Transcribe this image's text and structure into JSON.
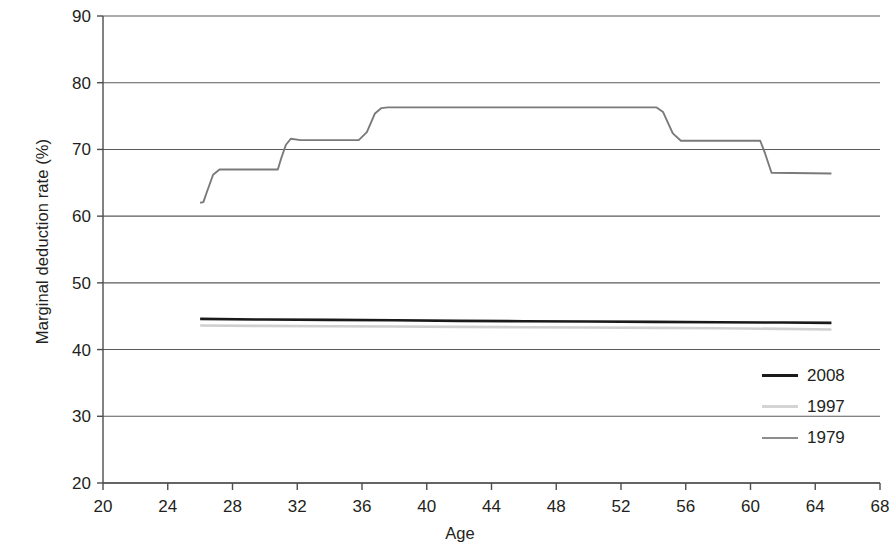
{
  "chart_data": {
    "type": "line",
    "title": "",
    "xlabel": "Age",
    "ylabel": "Marginal deduction rate (%)",
    "xlim": [
      20,
      68
    ],
    "ylim": [
      20,
      90
    ],
    "xticks": [
      20,
      24,
      28,
      32,
      36,
      40,
      44,
      48,
      52,
      56,
      60,
      64,
      68
    ],
    "yticks": [
      20,
      30,
      40,
      50,
      60,
      70,
      80,
      90
    ],
    "xtick_labels": [
      "20",
      "24",
      "28",
      "32",
      "36",
      "40",
      "44",
      "48",
      "52",
      "56",
      "60",
      "64",
      "68"
    ],
    "ytick_labels": [
      "20",
      "30",
      "40",
      "50",
      "60",
      "70",
      "80",
      "90"
    ],
    "grid": "horizontal",
    "legend_position": "right-inside-lower",
    "series": [
      {
        "name": "2008",
        "color": "#1a1a1a",
        "width": 2.6,
        "x": [
          26,
          30,
          34,
          38,
          42,
          46,
          50,
          54,
          58,
          62,
          65
        ],
        "y": [
          44.6,
          44.5,
          44.45,
          44.4,
          44.3,
          44.25,
          44.2,
          44.15,
          44.1,
          44.05,
          44.0
        ]
      },
      {
        "name": "1997",
        "color": "#cfcfcf",
        "width": 2.6,
        "x": [
          26,
          30,
          34,
          38,
          42,
          46,
          50,
          54,
          58,
          62,
          65
        ],
        "y": [
          43.6,
          43.55,
          43.5,
          43.45,
          43.4,
          43.35,
          43.3,
          43.25,
          43.2,
          43.1,
          43.0
        ]
      },
      {
        "name": "1979",
        "color": "#7a7a7a",
        "width": 1.9,
        "x": [
          26,
          26.2,
          26.4,
          26.8,
          27.2,
          30.8,
          31.0,
          31.3,
          31.6,
          32.2,
          35.8,
          36.3,
          36.8,
          37.2,
          37.6,
          54.2,
          54.6,
          55.2,
          55.7,
          60.6,
          60.9,
          61.3,
          65.0
        ],
        "y": [
          62.0,
          62.1,
          63.5,
          66.2,
          67.0,
          67.0,
          68.6,
          70.7,
          71.6,
          71.4,
          71.4,
          72.6,
          75.4,
          76.2,
          76.3,
          76.3,
          75.6,
          72.4,
          71.3,
          71.3,
          69.4,
          66.5,
          66.4
        ]
      }
    ],
    "legend": [
      {
        "label": "2008",
        "color": "#1a1a1a",
        "width": 3.2
      },
      {
        "label": "1997",
        "color": "#d4d4d4",
        "width": 3.2
      },
      {
        "label": "1979",
        "color": "#8c8c8c",
        "width": 2.4
      }
    ],
    "axis_color": "#4d4d4d",
    "grid_color": "#5a5a5a"
  }
}
